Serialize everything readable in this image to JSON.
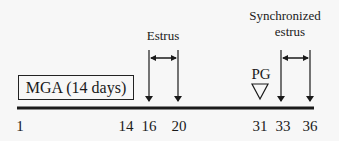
{
  "diagram": {
    "type": "timeline",
    "treatment_box": {
      "label": "MGA (14 days)"
    },
    "timeline": {
      "start_day": 1,
      "end_day": 36
    },
    "day_ticks": [
      {
        "label": "1",
        "x": 20
      },
      {
        "label": "14",
        "x": 127
      },
      {
        "label": "16",
        "x": 149
      },
      {
        "label": "20",
        "x": 178
      },
      {
        "label": "31",
        "x": 260
      },
      {
        "label": "33",
        "x": 282
      },
      {
        "label": "36",
        "x": 310
      }
    ],
    "periods": [
      {
        "label": "Estrus",
        "start_day": 16,
        "end_day": 20
      },
      {
        "label_line1": "Synchronized",
        "label_line2": "estrus",
        "start_day": 33,
        "end_day": 36
      }
    ],
    "events": [
      {
        "label": "PG",
        "day": 31,
        "marker": "open-down-triangle"
      }
    ],
    "colors": {
      "ink": "#1a1a1a",
      "background": "#f7f7f7"
    }
  }
}
